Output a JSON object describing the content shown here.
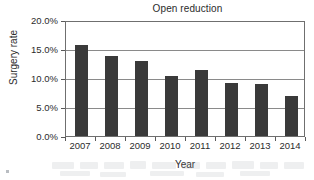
{
  "chart_data": {
    "type": "bar",
    "title": "Open reduction",
    "xlabel": "Year",
    "ylabel": "Surgery rate",
    "categories": [
      "2007",
      "2008",
      "2009",
      "2010",
      "2011",
      "2012",
      "2013",
      "2014"
    ],
    "values": [
      15.7,
      13.8,
      12.9,
      10.3,
      11.3,
      9.2,
      9.0,
      6.9
    ],
    "value_labels": [
      "15.7%",
      "13.8%",
      "12.9%",
      "10.3%",
      "11.3%",
      "9.2%",
      "9.0%",
      "6.9%"
    ],
    "ylim": [
      0.0,
      20.0
    ],
    "ytick_values": [
      0.0,
      5.0,
      10.0,
      15.0,
      20.0
    ],
    "ytick_labels": [
      "0.0%",
      "5.0%",
      "10.0%",
      "15.0%",
      "20.0%"
    ],
    "grid": "horizontal",
    "legend": "none",
    "series_color": "#3a3a3a",
    "axis_color": "#6f6f6f",
    "grid_color": "#8a8a8a",
    "text_color": "#2b2b2b",
    "background": "#ffffff"
  }
}
